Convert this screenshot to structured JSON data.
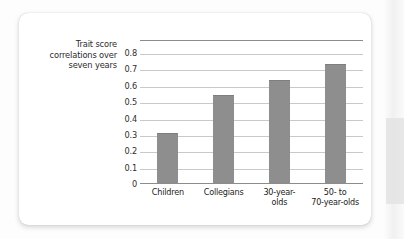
{
  "chart_data": {
    "type": "bar",
    "title": "",
    "subtitle": "",
    "xlabel": "",
    "ylabel": "Trait score correlations over seven years",
    "ylabel_lines": [
      "Trait score",
      "correlations over",
      "seven years"
    ],
    "categories": [
      "Children",
      "Collegians",
      "30-year-olds",
      "50- to 70-year-olds"
    ],
    "category_lines": [
      [
        "Children"
      ],
      [
        "Collegians"
      ],
      [
        "30-year-",
        "olds"
      ],
      [
        "50- to",
        "70-year-olds"
      ]
    ],
    "values": [
      0.305,
      0.535,
      0.63,
      0.725
    ],
    "ylim": [
      0,
      0.88
    ],
    "yticks": [
      0.8,
      0.7,
      0.6,
      0.5,
      0.4,
      0.3,
      0.2,
      0.1,
      0
    ],
    "ytick_labels": [
      "0.8",
      "0.7",
      "0.6",
      "0.5",
      "0.4",
      "0.3",
      "0.2",
      "0.1",
      "0"
    ],
    "grid": true,
    "legend": false,
    "legend_position": "none",
    "bar_color": "#8e8e8e",
    "gridline_color": "#c9c9c9",
    "axis_color": "#8c8c8c",
    "text_color": "#2b2b2b",
    "card_background": "#ffffff",
    "page_background": "#fdfdfd"
  }
}
